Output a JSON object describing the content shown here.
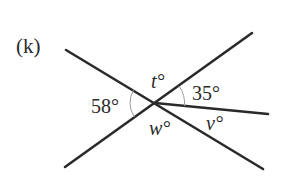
{
  "figure": {
    "part_label": "(k)",
    "angles": {
      "left": "58°",
      "top": "t°",
      "upper_right": "35°",
      "bottom": "w°",
      "lower_right": "v°"
    },
    "colors": {
      "line": "#2a2a2a",
      "arc": "#9a9a9a",
      "background": "#ffffff"
    }
  }
}
